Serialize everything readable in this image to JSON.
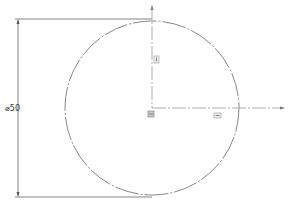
{
  "drawing": {
    "dimension_label": "⌀50",
    "circle": {
      "cx": 152,
      "cy": 108,
      "r": 87
    },
    "colors": {
      "outline": "#777777",
      "dimension": "#555555",
      "icon": "#888888",
      "background": "#ffffff"
    },
    "icons": [
      {
        "name": "vertical-constraint-icon",
        "x": 155,
        "y": 57
      },
      {
        "name": "origin-icon",
        "x": 148,
        "y": 112
      },
      {
        "name": "horizontal-constraint-icon",
        "x": 215,
        "y": 113
      }
    ]
  }
}
